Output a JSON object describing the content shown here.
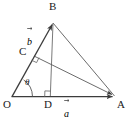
{
  "figure": {
    "type": "geometry-vector-diagram",
    "background_color": "#ffffff",
    "stroke_color": "#3c3c3c",
    "label_color": "#1a1a1a"
  },
  "points": {
    "origin": {
      "label": "O",
      "x": 12,
      "y": 97,
      "label_x": 3,
      "label_y": 99
    },
    "apex": {
      "label": "B",
      "x": 53,
      "y": 22,
      "label_x": 50,
      "label_y": 2
    },
    "right": {
      "label": "A",
      "x": 115,
      "y": 97,
      "label_x": 117,
      "label_y": 99
    },
    "foot_on_ob": {
      "label": "C",
      "x": 33,
      "y": 55,
      "label_x": 20,
      "label_y": 47
    },
    "foot_on_oa": {
      "label": "D",
      "x": 50,
      "y": 97,
      "label_x": 44,
      "label_y": 99
    }
  },
  "vectors": {
    "a": {
      "label": "a",
      "from": "O",
      "to": "A",
      "label_x": 64,
      "label_y": 100
    },
    "b": {
      "label": "b",
      "from": "O",
      "to": "B",
      "label_x": 27,
      "label_y": 28
    }
  },
  "angle": {
    "label": "θ",
    "at": "O",
    "between": [
      "OA",
      "OB"
    ],
    "label_x": 25,
    "label_y": 80
  },
  "right_angle_marks": [
    {
      "at": "D",
      "name": "right-angle-at-d"
    },
    {
      "at": "C",
      "name": "right-angle-at-c"
    }
  ],
  "segments": [
    {
      "name": "segment-o-a",
      "from": "O",
      "to": "A",
      "arrow": true
    },
    {
      "name": "segment-o-b",
      "from": "O",
      "to": "B",
      "arrow": true
    },
    {
      "name": "segment-b-a",
      "from": "B",
      "to": "A",
      "arrow": false
    },
    {
      "name": "segment-b-d",
      "from": "B",
      "to": "D",
      "arrow": false
    },
    {
      "name": "segment-c-a",
      "from": "C",
      "to": "A",
      "arrow": true
    }
  ]
}
